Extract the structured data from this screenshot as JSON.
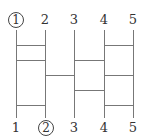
{
  "diagram": {
    "type": "amidakuji-ladder",
    "top_labels": [
      {
        "text": "1",
        "circled": true
      },
      {
        "text": "2",
        "circled": false
      },
      {
        "text": "3",
        "circled": false
      },
      {
        "text": "4",
        "circled": false
      },
      {
        "text": "5",
        "circled": false
      }
    ],
    "bottom_labels": [
      {
        "text": "1",
        "circled": false
      },
      {
        "text": "2",
        "circled": true
      },
      {
        "text": "3",
        "circled": false
      },
      {
        "text": "4",
        "circled": false
      },
      {
        "text": "5",
        "circled": false
      }
    ],
    "rungs": [
      {
        "from": 1,
        "to": 2,
        "y": 45
      },
      {
        "from": 4,
        "to": 5,
        "y": 45
      },
      {
        "from": 1,
        "to": 2,
        "y": 60
      },
      {
        "from": 3,
        "to": 4,
        "y": 60
      },
      {
        "from": 2,
        "to": 3,
        "y": 75
      },
      {
        "from": 4,
        "to": 5,
        "y": 75
      },
      {
        "from": 3,
        "to": 4,
        "y": 90
      },
      {
        "from": 1,
        "to": 2,
        "y": 105
      },
      {
        "from": 4,
        "to": 5,
        "y": 105
      }
    ],
    "line_color": "#777777"
  }
}
